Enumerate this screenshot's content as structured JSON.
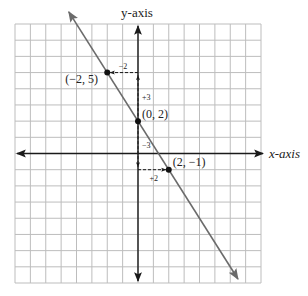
{
  "chart_data": {
    "type": "line",
    "title": "",
    "xlabel": "x-axis",
    "ylabel": "y-axis",
    "xlim": [
      -8,
      8
    ],
    "ylim": [
      -8,
      8
    ],
    "grid": true,
    "line": {
      "slope": -1.5,
      "intercept": 2,
      "x_range": [
        -4.5,
        6.5
      ]
    },
    "points": [
      {
        "x": -2,
        "y": 5,
        "label": "(−2, 5)"
      },
      {
        "x": 0,
        "y": 2,
        "label": "(0, 2)"
      },
      {
        "x": 2,
        "y": -1,
        "label": "(2, −1)"
      }
    ],
    "steps": [
      {
        "from": [
          0,
          2
        ],
        "to": [
          0,
          5
        ],
        "label": "+3",
        "kind": "rise"
      },
      {
        "from": [
          0,
          5
        ],
        "to": [
          -2,
          5
        ],
        "label": "−2",
        "kind": "run"
      },
      {
        "from": [
          0,
          2
        ],
        "to": [
          0,
          -1
        ],
        "label": "−3",
        "kind": "rise"
      },
      {
        "from": [
          0,
          -1
        ],
        "to": [
          2,
          -1
        ],
        "label": "+2",
        "kind": "run"
      }
    ],
    "colors": {
      "grid": "#bdbdbd",
      "axis": "#1a1a1a",
      "line": "#6b6b6b",
      "point": "#111111"
    }
  }
}
